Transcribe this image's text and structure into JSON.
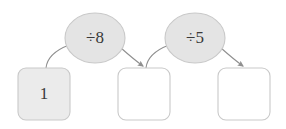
{
  "diagram": {
    "type": "function-machine-flow",
    "title": "",
    "colors": {
      "box_filled_bg": "#ebebeb",
      "box_empty_bg": "#ffffff",
      "box_stroke": "#c9c9c9",
      "ellipse_bg": "#e4e4e4",
      "ellipse_stroke": "#c9c9c9",
      "arrow_stroke": "#8f8f8f",
      "text_color": "#3a3a3a",
      "page_bg": "#ffffff"
    },
    "boxes": [
      {
        "id": "box-1",
        "value": "1",
        "filled": true,
        "x": 18,
        "y": 68,
        "w": 52,
        "h": 52
      },
      {
        "id": "box-2",
        "value": "",
        "filled": false,
        "x": 118,
        "y": 68,
        "w": 52,
        "h": 52
      },
      {
        "id": "box-3",
        "value": "",
        "filled": false,
        "x": 218,
        "y": 68,
        "w": 52,
        "h": 52
      }
    ],
    "operations": [
      {
        "id": "op-1",
        "label": "÷8",
        "cx": 95,
        "cy": 38,
        "rx": 30,
        "ry": 25
      },
      {
        "id": "op-2",
        "label": "÷5",
        "cx": 195,
        "cy": 38,
        "rx": 30,
        "ry": 25
      }
    ],
    "arrows": [
      {
        "id": "arrow-box1-to-op1",
        "from": "box-1",
        "to": "op-1",
        "arrowhead": false,
        "path": "M 46 68 C 47 58 56 50 69 45"
      },
      {
        "id": "arrow-op1-to-box2",
        "from": "op-1",
        "to": "box-2",
        "arrowhead": true,
        "path": "M 121 48 C 130 56 136 61 143 66"
      },
      {
        "id": "arrow-box2-to-op2",
        "from": "box-2",
        "to": "op-2",
        "arrowhead": false,
        "path": "M 146 68 C 147 58 156 50 169 45"
      },
      {
        "id": "arrow-op2-to-box3",
        "from": "op-2",
        "to": "box-3",
        "arrowhead": true,
        "path": "M 221 48 C 230 56 236 61 243 66"
      }
    ]
  }
}
